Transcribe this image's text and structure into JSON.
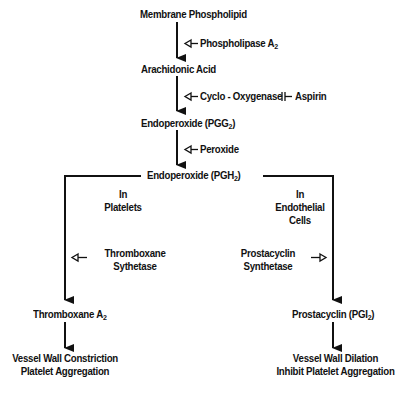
{
  "nodes": {
    "membrane": "Membrane Phospholipid",
    "arachidonic": "Arachidonic Acid",
    "pgg2": {
      "text": "Endoperoxide (PGG",
      "sub": "2",
      "tail": ")"
    },
    "pgh2": {
      "text": "Endoperoxide (PGH",
      "sub": "2",
      "tail": ")"
    },
    "thromboxane": {
      "text": "Thromboxane A",
      "sub": "2"
    },
    "prostacyclin": {
      "text": "Prostacyclin (PGI",
      "sub": "2",
      "tail": ")"
    },
    "left_effect": [
      "Vessel Wall Constriction",
      "Platelet Aggregation"
    ],
    "right_effect": [
      "Vessel Wall Dilation",
      "Inhibit Platelet Aggregation"
    ]
  },
  "enzymes": {
    "phospholipase": {
      "text": "Phospholipase A",
      "sub": "2"
    },
    "cyclooxygenase": "Cyclo - Oxygenase",
    "inhibitor": "Aspirin",
    "peroxide": "Peroxide",
    "thromboxane_synthetase": [
      "Thromboxane",
      "Sythetase"
    ],
    "prostacyclin_synthetase": [
      "Prostacyclin",
      "Synthetase"
    ]
  },
  "locations": {
    "left": [
      "In",
      "Platelets"
    ],
    "right": [
      "In",
      "Endothelial",
      "Cells"
    ]
  }
}
